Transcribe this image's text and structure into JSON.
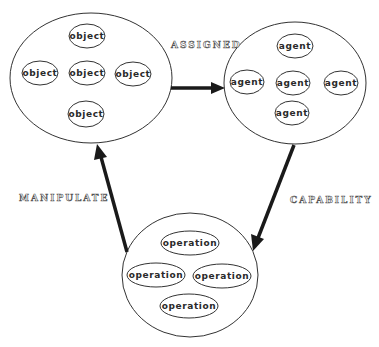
{
  "diagram": {
    "groups": {
      "objects": {
        "label": "objects-group",
        "items": [
          "object",
          "object",
          "object",
          "object",
          "object"
        ]
      },
      "agents": {
        "label": "agents-group",
        "items": [
          "agent",
          "agent",
          "agent",
          "agent",
          "agent"
        ]
      },
      "operations": {
        "label": "operations-group",
        "items": [
          "operation",
          "operation",
          "operation",
          "operation"
        ]
      }
    },
    "edges": {
      "assigned": {
        "label": "ASSIGNED",
        "from": "objects",
        "to": "agents"
      },
      "capability": {
        "label": "CAPABILITY",
        "from": "agents",
        "to": "operations"
      },
      "manipulate": {
        "label": "MANIPULATE",
        "from": "operations",
        "to": "objects"
      }
    },
    "colors": {
      "background": "#ffffff",
      "stroke": "#333333",
      "arrow": "#1a1a1a",
      "text": "#2a2a2a",
      "label_outline": "#555555"
    }
  }
}
